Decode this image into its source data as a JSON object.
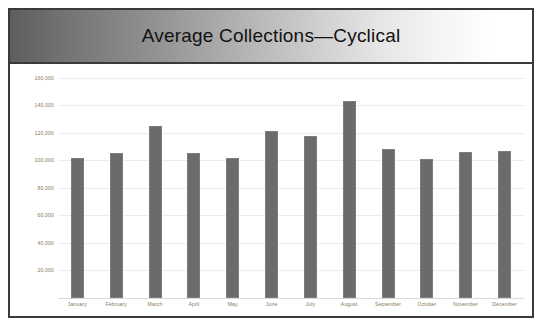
{
  "chart": {
    "title": "Average Collections—Cyclical",
    "frame_border_color": "#3a3a3a",
    "bar_color": "#6b6b6b",
    "axis_label_color": "#8a7a5a",
    "gridline_color": "#ececec",
    "background_color": "#ffffff",
    "title_gradient_from": "#5d5d5d",
    "title_gradient_to": "#ffffff"
  },
  "chart_data": {
    "type": "bar",
    "title": "Average Collections—Cyclical",
    "xlabel": "",
    "ylabel": "",
    "categories": [
      "January",
      "February",
      "March",
      "April",
      "May",
      "June",
      "July",
      "August",
      "September",
      "October",
      "November",
      "December"
    ],
    "values": [
      102000,
      105000,
      125000,
      105000,
      102000,
      121000,
      118000,
      143000,
      108000,
      101000,
      106000,
      107000
    ],
    "ylim": [
      0,
      170000
    ],
    "yticks": [
      20000,
      40000,
      60000,
      80000,
      100000,
      120000,
      140000,
      160000
    ],
    "ytick_labels": [
      "20,000",
      "40,000",
      "60,000",
      "80,000",
      "100,000",
      "120,000",
      "140,000",
      "160,000"
    ],
    "grid": true,
    "legend": false,
    "legend_position": "none"
  }
}
